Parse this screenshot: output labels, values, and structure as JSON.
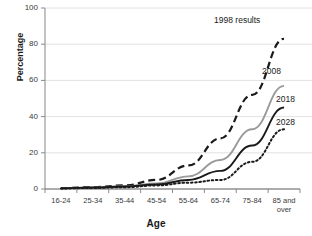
{
  "chart_data": {
    "type": "line",
    "title": "",
    "xlabel": "Age",
    "ylabel": "Percentage",
    "categories": [
      "16-24",
      "25-34",
      "35-44",
      "45-54",
      "55-64",
      "65-74",
      "75-84",
      "85 and over"
    ],
    "category_last_line1": "85 and",
    "category_last_line2": "over",
    "ylim": [
      0,
      100
    ],
    "yticks": [
      0,
      20,
      40,
      60,
      80,
      100
    ],
    "grid": "horizontal",
    "legend_position": "inline-right-of-series",
    "series": [
      {
        "name": "1998 results",
        "style": "dashed",
        "color": "#1a1a1a",
        "values": [
          0.5,
          1,
          2,
          5,
          13,
          28,
          52,
          83
        ]
      },
      {
        "name": "2008",
        "style": "solid",
        "color": "#9a9a9a",
        "values": [
          0.4,
          0.8,
          1.5,
          3,
          7,
          16,
          33,
          57
        ]
      },
      {
        "name": "2018",
        "style": "solid",
        "color": "#1a1a1a",
        "values": [
          0.4,
          0.8,
          1.4,
          2.5,
          5,
          10,
          24,
          45
        ]
      },
      {
        "name": "2028",
        "style": "dotted",
        "color": "#1a1a1a",
        "values": [
          0.3,
          0.6,
          1,
          2,
          3.5,
          5,
          15,
          33
        ]
      }
    ]
  }
}
